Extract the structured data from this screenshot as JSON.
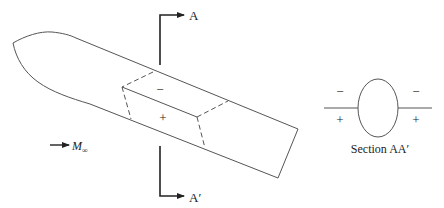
{
  "figure": {
    "type": "aerodynamic-body-diagram",
    "colors": {
      "line": "#555555",
      "arrow": "#222222",
      "text": "#222222"
    }
  },
  "labels": {
    "section_top": "A",
    "section_bottom": "A′",
    "panel_upper_sign": "−",
    "panel_lower_sign": "+",
    "freestream": "M",
    "freestream_sub": "∞"
  },
  "section_view": {
    "caption": "Section AA′",
    "upper_left_sign": "−",
    "lower_left_sign": "+",
    "upper_right_sign": "−",
    "lower_right_sign": "+"
  }
}
